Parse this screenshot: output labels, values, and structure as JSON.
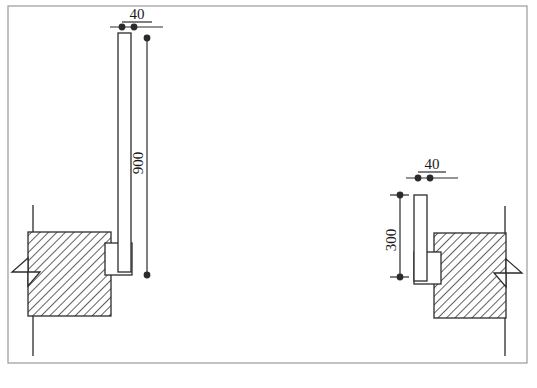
{
  "drawing": {
    "title": "Bracket Mounting Detail",
    "background_color": "#ffffff",
    "line_color": "#2b2b2b",
    "hatch_color": "#3a3a3a",
    "frame": {
      "x": 8,
      "y": 6,
      "width": 519,
      "height": 357
    }
  },
  "dimensions": [
    {
      "id": "left-width",
      "label": "40",
      "orientation": "horizontal",
      "text_x": 137,
      "text_y": 19,
      "underline": {
        "x1": 122,
        "y1": 22,
        "x2": 152,
        "y2": 22
      },
      "line": {
        "x1": 110,
        "y1": 27,
        "x2": 163,
        "y2": 27
      },
      "dots": [
        {
          "cx": 122,
          "cy": 27
        },
        {
          "cx": 134,
          "cy": 27
        }
      ]
    },
    {
      "id": "left-height",
      "label": "900",
      "orientation": "vertical",
      "text_x": 147,
      "text_y": 163,
      "line": {
        "x1": 147,
        "y1": 38,
        "x2": 147,
        "y2": 275
      },
      "dots": [
        {
          "cx": 147,
          "cy": 38
        },
        {
          "cx": 147,
          "cy": 275
        }
      ]
    },
    {
      "id": "right-width",
      "label": "40",
      "orientation": "horizontal",
      "text_x": 432,
      "text_y": 169,
      "underline": {
        "x1": 418,
        "y1": 172,
        "x2": 446,
        "y2": 172
      },
      "line": {
        "x1": 406,
        "y1": 178,
        "x2": 458,
        "y2": 178
      },
      "dots": [
        {
          "cx": 418,
          "cy": 178
        },
        {
          "cx": 430,
          "cy": 178
        }
      ]
    },
    {
      "id": "right-height",
      "label": "300",
      "orientation": "vertical",
      "text_x": 400,
      "text_y": 240,
      "line": {
        "x1": 400,
        "y1": 195,
        "x2": 400,
        "y2": 277
      },
      "dots": [
        {
          "cx": 400,
          "cy": 195
        },
        {
          "cx": 400,
          "cy": 277
        }
      ],
      "ticks": [
        {
          "x1": 390,
          "y1": 195,
          "x2": 409,
          "y2": 195
        },
        {
          "x1": 390,
          "y1": 277,
          "x2": 409,
          "y2": 277
        }
      ]
    }
  ],
  "parts": {
    "left_assembly": {
      "name": "left-assembly",
      "bar": {
        "x": 118,
        "y": 33,
        "width": 13,
        "height": 239
      },
      "bracket": {
        "x": 105,
        "y": 243,
        "width": 27,
        "height": 32
      },
      "block": {
        "x": 28,
        "y": 232,
        "width": 83,
        "height": 84
      },
      "wall_line": {
        "x1": 33,
        "y1": 205,
        "x2": 33,
        "y2": 356
      },
      "break_line": [
        [
          28,
          258
        ],
        [
          12,
          272
        ],
        [
          40,
          272
        ],
        [
          28,
          286
        ]
      ]
    },
    "right_assembly": {
      "name": "right-assembly",
      "bar": {
        "x": 414,
        "y": 195,
        "width": 13,
        "height": 86
      },
      "bracket": {
        "x": 414,
        "y": 252,
        "width": 27,
        "height": 32
      },
      "block": {
        "x": 434,
        "y": 233,
        "width": 72,
        "height": 85
      },
      "wall_line": {
        "x1": 505,
        "y1": 206,
        "x2": 505,
        "y2": 356
      },
      "break_line": [
        [
          506,
          259
        ],
        [
          522,
          273
        ],
        [
          494,
          273
        ],
        [
          506,
          287
        ]
      ]
    }
  }
}
